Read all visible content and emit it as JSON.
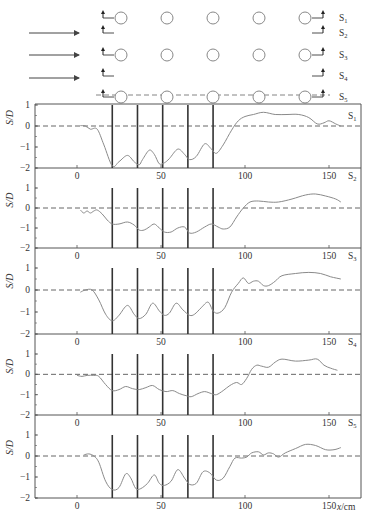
{
  "colors": {
    "curve": "#8a8a8a",
    "axis": "#555555",
    "bar": "#333333",
    "zero_line": "#555555",
    "circle": "#888888",
    "arrow": "#444444"
  },
  "schematic": {
    "flow_arrows_y": [
      33,
      55,
      78
    ],
    "section_labels": [
      "S1",
      "S2",
      "S3",
      "S4",
      "S5"
    ],
    "circle_rows": 3,
    "circle_columns": 5
  },
  "caption": "",
  "chart_data": {
    "type": "line",
    "title": "",
    "xlabel": "x/cm",
    "ylabel": "S/D",
    "xlim": [
      -30,
      170
    ],
    "ylim": [
      -2,
      1
    ],
    "xticks": [
      0,
      50,
      100,
      150
    ],
    "yticks": [
      1,
      0,
      -1,
      -2
    ],
    "grid": false,
    "reference_line": {
      "y": 0,
      "style": "dashed"
    },
    "pile_positions_cm": [
      21,
      36,
      51,
      66,
      81
    ],
    "panels": [
      {
        "label": "S1",
        "x": [
          2,
          5,
          8,
          12,
          16,
          21,
          25,
          30,
          34,
          37,
          39,
          43,
          46,
          49,
          52,
          55,
          60,
          64,
          67,
          71,
          76,
          80,
          83,
          87,
          92,
          96,
          100,
          105,
          111,
          118,
          125,
          132,
          138,
          143,
          147,
          150,
          154,
          157
        ],
        "values": [
          0.02,
          0.0,
          -0.15,
          -0.15,
          -0.9,
          -1.9,
          -1.7,
          -1.4,
          -1.7,
          -1.85,
          -1.6,
          -1.15,
          -1.35,
          -1.8,
          -1.75,
          -1.55,
          -1.1,
          -1.35,
          -1.6,
          -1.45,
          -0.85,
          -1.1,
          -1.3,
          -0.9,
          -0.2,
          0.25,
          0.45,
          0.55,
          0.65,
          0.55,
          0.55,
          0.55,
          0.4,
          0.1,
          0.15,
          0.25,
          0.1,
          0.0
        ]
      },
      {
        "label": "S2",
        "x": [
          2,
          4,
          6,
          8,
          10,
          12,
          15,
          18,
          21,
          25,
          30,
          34,
          37,
          40,
          43,
          46,
          49,
          52,
          56,
          60,
          64,
          67,
          71,
          76,
          80,
          84,
          87,
          91,
          95,
          99,
          103,
          108,
          114,
          120,
          128,
          136,
          142,
          148,
          154,
          157
        ],
        "values": [
          -0.1,
          -0.25,
          -0.15,
          -0.25,
          -0.15,
          -0.1,
          -0.3,
          -0.6,
          -0.8,
          -0.8,
          -0.7,
          -0.85,
          -1.1,
          -1.1,
          -0.95,
          -0.8,
          -1.0,
          -1.2,
          -1.2,
          -1.0,
          -0.95,
          -1.25,
          -1.2,
          -0.95,
          -0.8,
          -0.95,
          -1.05,
          -0.95,
          -0.45,
          0.0,
          0.3,
          0.35,
          0.3,
          0.3,
          0.45,
          0.65,
          0.7,
          0.6,
          0.45,
          0.3
        ]
      },
      {
        "label": "S3",
        "x": [
          2,
          5,
          9,
          13,
          17,
          21,
          25,
          30,
          34,
          37,
          41,
          45,
          49,
          52,
          55,
          59,
          63,
          67,
          70,
          74,
          78,
          81,
          84,
          88,
          92,
          96,
          99,
          102,
          105,
          108,
          111,
          114,
          118,
          122,
          130,
          138,
          145,
          151,
          157
        ],
        "values": [
          -0.1,
          0.0,
          0.0,
          -0.45,
          -1.1,
          -1.4,
          -1.15,
          -0.7,
          -1.1,
          -1.3,
          -1.1,
          -0.6,
          -0.95,
          -1.15,
          -1.05,
          -0.6,
          -0.9,
          -1.15,
          -1.1,
          -0.8,
          -0.55,
          -0.95,
          -1.05,
          -0.8,
          -0.1,
          0.3,
          0.55,
          0.3,
          0.4,
          0.4,
          0.2,
          0.2,
          0.4,
          0.65,
          0.75,
          0.8,
          0.75,
          0.6,
          0.5
        ]
      },
      {
        "label": "S4",
        "x": [
          0,
          3,
          6,
          10,
          13,
          17,
          21,
          25,
          29,
          33,
          37,
          41,
          45,
          49,
          53,
          57,
          61,
          65,
          68,
          72,
          76,
          80,
          83,
          87,
          91,
          95,
          98,
          101,
          104,
          107,
          110,
          114,
          118,
          122,
          130,
          138,
          143,
          147,
          151,
          155
        ],
        "values": [
          -0.05,
          -0.1,
          -0.05,
          -0.05,
          -0.1,
          -0.5,
          -0.8,
          -0.75,
          -0.6,
          -0.7,
          -0.75,
          -0.65,
          -0.55,
          -0.75,
          -0.85,
          -0.8,
          -0.95,
          -1.05,
          -1.1,
          -0.95,
          -0.85,
          -0.95,
          -1.0,
          -0.8,
          -0.55,
          -0.4,
          -0.5,
          -0.2,
          0.25,
          0.45,
          0.4,
          0.35,
          0.6,
          0.75,
          0.65,
          0.7,
          0.75,
          0.45,
          0.3,
          0.2
        ]
      },
      {
        "label": "S5",
        "x": [
          4,
          7,
          10,
          13,
          17,
          21,
          25,
          29,
          32,
          35,
          38,
          42,
          46,
          49,
          52,
          56,
          60,
          64,
          67,
          71,
          75,
          79,
          83,
          87,
          91,
          94,
          98,
          101,
          104,
          108,
          111,
          114,
          117,
          120,
          124,
          130,
          136,
          142,
          148,
          153,
          157
        ],
        "values": [
          0.05,
          0.1,
          0.0,
          -0.3,
          -1.2,
          -1.6,
          -1.5,
          -0.85,
          -1.05,
          -1.55,
          -1.55,
          -1.3,
          -0.9,
          -1.3,
          -1.4,
          -1.2,
          -0.65,
          -1.05,
          -1.35,
          -1.3,
          -0.75,
          -0.8,
          -1.15,
          -1.05,
          -0.5,
          -0.1,
          -0.1,
          -0.05,
          0.15,
          0.2,
          0.05,
          0.15,
          0.1,
          -0.05,
          0.15,
          0.35,
          0.55,
          0.5,
          0.3,
          0.3,
          0.4
        ]
      }
    ]
  }
}
